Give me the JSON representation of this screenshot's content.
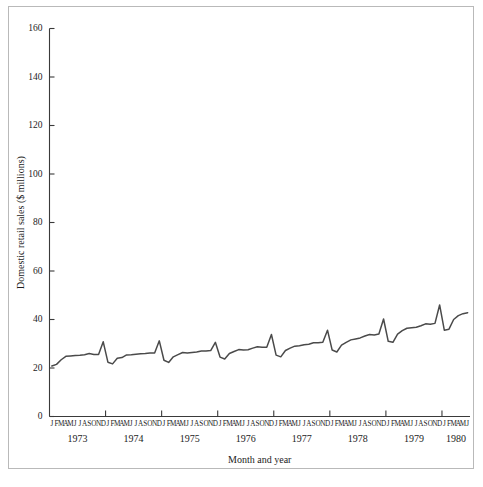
{
  "chart_data": {
    "type": "line",
    "title": "",
    "xlabel": "Month and year",
    "ylabel": "Domestic retail sales ($ millions)",
    "ylim": [
      0,
      160
    ],
    "yticks": [
      0,
      20,
      40,
      60,
      80,
      100,
      120,
      140,
      160
    ],
    "ytick_labels": [
      "0",
      "20",
      "40",
      "60",
      "80",
      "100",
      "120",
      "140",
      "160"
    ],
    "grid": false,
    "legend_position": "none",
    "month_letters": [
      "J",
      "F",
      "M",
      "A",
      "M",
      "J",
      "J",
      "A",
      "S",
      "O",
      "N",
      "D"
    ],
    "years": [
      "1973",
      "1974",
      "1975",
      "1976",
      "1977",
      "1978",
      "1979",
      "1980"
    ],
    "x_start": "1973-01",
    "x_end": "1980-06",
    "series": [
      {
        "name": "Domestic retail sales",
        "color": "#4a4a4a",
        "x": [
          "1973-01",
          "1973-02",
          "1973-03",
          "1973-04",
          "1973-05",
          "1973-06",
          "1973-07",
          "1973-08",
          "1973-09",
          "1973-10",
          "1973-11",
          "1973-12",
          "1974-01",
          "1974-02",
          "1974-03",
          "1974-04",
          "1974-05",
          "1974-06",
          "1974-07",
          "1974-08",
          "1974-09",
          "1974-10",
          "1974-11",
          "1974-12",
          "1975-01",
          "1975-02",
          "1975-03",
          "1975-04",
          "1975-05",
          "1975-06",
          "1975-07",
          "1975-08",
          "1975-09",
          "1975-10",
          "1975-11",
          "1975-12",
          "1976-01",
          "1976-02",
          "1976-03",
          "1976-04",
          "1976-05",
          "1976-06",
          "1976-07",
          "1976-08",
          "1976-09",
          "1976-10",
          "1976-11",
          "1976-12",
          "1977-01",
          "1977-02",
          "1977-03",
          "1977-04",
          "1977-05",
          "1977-06",
          "1977-07",
          "1977-08",
          "1977-09",
          "1977-10",
          "1977-11",
          "1977-12",
          "1978-01",
          "1978-02",
          "1978-03",
          "1978-04",
          "1978-05",
          "1978-06",
          "1978-07",
          "1978-08",
          "1978-09",
          "1978-10",
          "1978-11",
          "1978-12",
          "1979-01",
          "1979-02",
          "1979-03",
          "1979-04",
          "1979-05",
          "1979-06",
          "1979-07",
          "1979-08",
          "1979-09",
          "1979-10",
          "1979-11",
          "1979-12",
          "1980-01",
          "1980-02",
          "1980-03",
          "1980-04",
          "1980-05",
          "1980-06"
        ],
        "values": [
          20.8,
          21.5,
          23.4,
          24.8,
          25.0,
          25.2,
          25.3,
          25.5,
          26.0,
          25.6,
          25.6,
          30.8,
          22.4,
          21.7,
          24.0,
          24.3,
          25.4,
          25.5,
          25.7,
          25.9,
          26.0,
          26.2,
          26.2,
          31.2,
          23.2,
          22.3,
          24.6,
          25.5,
          26.4,
          26.2,
          26.4,
          26.6,
          27.0,
          27.0,
          27.2,
          30.6,
          24.5,
          23.7,
          26.0,
          26.8,
          27.6,
          27.4,
          27.5,
          28.2,
          28.8,
          28.6,
          28.6,
          33.8,
          25.3,
          24.6,
          27.2,
          28.2,
          29.0,
          29.2,
          29.6,
          29.8,
          30.4,
          30.4,
          30.6,
          35.6,
          27.4,
          26.6,
          29.4,
          30.6,
          31.6,
          32.0,
          32.4,
          33.2,
          33.8,
          33.6,
          34.0,
          40.2,
          31.0,
          30.6,
          34.0,
          35.4,
          36.4,
          36.6,
          36.8,
          37.4,
          38.2,
          38.0,
          38.4,
          46.0,
          35.6,
          36.0,
          40.0,
          41.6,
          42.4,
          42.8
        ]
      }
    ],
    "annotations": []
  },
  "figure": {
    "axis_color": "#3a3a3a",
    "frame_color": "#b9b9b9",
    "background": "#ffffff"
  }
}
